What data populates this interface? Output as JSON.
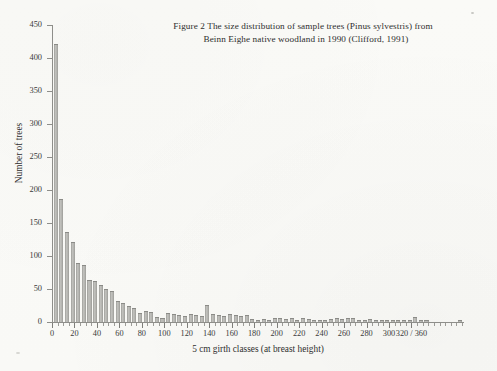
{
  "figure": {
    "title_line_1": "Figure 2  The size distribution of sample trees (Pinus sylvestris) from",
    "title_line_2": "Beinn Eighe native woodland in 1990 (Clifford, 1991)"
  },
  "axes": {
    "y_title": "Number of trees",
    "x_title": "5 cm girth classes (at breast height)",
    "y_ticks": [
      "0",
      "50",
      "100",
      "150",
      "200",
      "250",
      "300",
      "350",
      "400",
      "450"
    ],
    "x_ticks": [
      "0",
      "20",
      "40",
      "60",
      "80",
      "100",
      "120",
      "140",
      "160",
      "180",
      "200",
      "220",
      "240",
      "260",
      "280",
      "300",
      "320 / 360"
    ]
  },
  "colors": {
    "bar_fill": "#b4b4b0",
    "bar_edge": "#8b8b87",
    "axis": "#8e8e8a",
    "text": "#2e2e2e",
    "paper": "#fbfbf9"
  },
  "chart_data": {
    "type": "bar",
    "title": "Figure 2  The size distribution of sample trees (Pinus sylvestris) from Beinn Eighe native woodland in 1990 (Clifford, 1991)",
    "xlabel": "5 cm girth classes (at breast height)",
    "ylabel": "Number of trees",
    "xlim": [
      0,
      365
    ],
    "ylim": [
      0,
      450
    ],
    "ytick_step": 50,
    "xtick_step": 20,
    "bin_width": 5,
    "grid": false,
    "legend": null,
    "x": [
      0,
      5,
      10,
      15,
      20,
      25,
      30,
      35,
      40,
      45,
      50,
      55,
      60,
      65,
      70,
      75,
      80,
      85,
      90,
      95,
      100,
      105,
      110,
      115,
      120,
      125,
      130,
      135,
      140,
      145,
      150,
      155,
      160,
      165,
      170,
      175,
      180,
      185,
      190,
      195,
      200,
      205,
      210,
      215,
      220,
      225,
      230,
      235,
      240,
      245,
      250,
      255,
      260,
      265,
      270,
      275,
      280,
      285,
      290,
      295,
      300,
      305,
      310,
      315,
      320,
      325,
      330,
      335,
      340,
      345,
      350,
      355,
      360
    ],
    "values": [
      420,
      185,
      135,
      120,
      88,
      85,
      62,
      60,
      55,
      48,
      45,
      30,
      28,
      22,
      20,
      12,
      15,
      14,
      6,
      4,
      12,
      10,
      9,
      8,
      11,
      9,
      7,
      24,
      11,
      9,
      8,
      10,
      9,
      8,
      9,
      3,
      2,
      3,
      2,
      4,
      5,
      3,
      4,
      2,
      5,
      3,
      2,
      1,
      2,
      3,
      4,
      3,
      5,
      4,
      2,
      1,
      3,
      2,
      1,
      1,
      2,
      1,
      1,
      1,
      6,
      1,
      1,
      0,
      0,
      0,
      0,
      0,
      1
    ]
  }
}
